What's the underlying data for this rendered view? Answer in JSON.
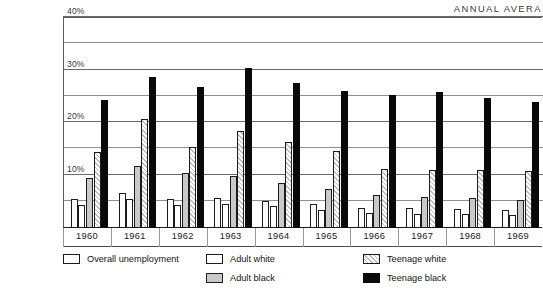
{
  "caption": {
    "title_clipped": "unem-\nlt and\nnd\nited\n0 to",
    "source_clipped": ", June 29,\n80 by The"
  },
  "header": {
    "title_clipped": "ANNUAL AVERA"
  },
  "legend": {
    "items": [
      {
        "label": "Overall unemployment",
        "swatch": "white-box",
        "key": "overall"
      },
      {
        "label": "Adult white",
        "swatch": "white-box",
        "key": "adult_white"
      },
      {
        "label": "Adult black",
        "swatch": "gray-box",
        "key": "adult_black"
      },
      {
        "label": "Teenage white",
        "swatch": "hatched-box",
        "key": "teen_white"
      },
      {
        "label": "Teenage black",
        "swatch": "black-box",
        "key": "teen_black"
      }
    ]
  },
  "colors": {
    "overall": "#ffffff",
    "adult_white": "#ffffff",
    "adult_black": "#c9c9c9",
    "teen_white": "#e8e8e8",
    "teen_black": "#0a0a0a",
    "grid": "#8e8e8e",
    "frame": "#5a5a5a"
  },
  "chart_data": {
    "type": "bar",
    "title": "ANNUAL AVERA",
    "xlabel": "",
    "ylabel": "",
    "ylim": [
      0,
      40
    ],
    "ytick_values": [
      10,
      20,
      30,
      40
    ],
    "ytick_labels": [
      "10%",
      "20%",
      "30%",
      "40%"
    ],
    "gridline_values": [
      5,
      10,
      15,
      20,
      25,
      30,
      35,
      40
    ],
    "grid": true,
    "legend_position": "below",
    "categories": [
      "1960",
      "1961",
      "1962",
      "1963",
      "1964",
      "1965",
      "1966",
      "1967",
      "1968",
      "1969"
    ],
    "series": [
      {
        "name": "Overall unemployment",
        "values": [
          5.5,
          6.7,
          5.5,
          5.7,
          5.2,
          4.5,
          3.8,
          3.8,
          3.6,
          3.5
        ]
      },
      {
        "name": "Adult white",
        "values": [
          4.4,
          5.5,
          4.4,
          4.6,
          4.1,
          3.4,
          2.8,
          2.7,
          2.6,
          2.5
        ]
      },
      {
        "name": "Adult black",
        "values": [
          9.6,
          11.8,
          10.4,
          9.9,
          8.6,
          7.4,
          6.3,
          6.0,
          5.8,
          5.4
        ]
      },
      {
        "name": "Teenage white",
        "values": [
          14.5,
          20.7,
          15.5,
          18.4,
          16.3,
          14.7,
          11.2,
          11.0,
          11.0,
          10.8
        ]
      },
      {
        "name": "Teenage black",
        "values": [
          24.4,
          28.8,
          26.8,
          30.4,
          27.6,
          26.1,
          25.3,
          26.0,
          24.8,
          24.0
        ]
      }
    ]
  },
  "xaxis": {
    "ticks": [
      "1960",
      "1961",
      "1962",
      "1963",
      "1964",
      "1965",
      "1966",
      "1967",
      "1968",
      "1969"
    ]
  }
}
